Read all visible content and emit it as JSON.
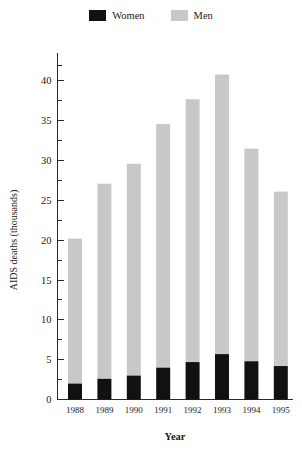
{
  "legend": {
    "entries": [
      {
        "label": "Women",
        "color": "#111111",
        "icon": "legend-swatch-women"
      },
      {
        "label": "Men",
        "color": "#c8c8c8",
        "icon": "legend-swatch-men"
      }
    ]
  },
  "chart_data": {
    "type": "bar",
    "subtype": "stacked-vertical",
    "title": "",
    "xlabel": "Year",
    "ylabel": "AIDS deaths (thousands)",
    "categories": [
      "1988",
      "1989",
      "1990",
      "1991",
      "1992",
      "1993",
      "1994",
      "1995"
    ],
    "series": [
      {
        "name": "Women",
        "color": "#111111",
        "values": [
          2.0,
          2.6,
          3.0,
          4.0,
          4.7,
          5.7,
          4.8,
          4.2
        ]
      },
      {
        "name": "Men",
        "color": "#c8c8c8",
        "values": [
          18.2,
          24.5,
          26.6,
          30.6,
          33.0,
          35.1,
          26.7,
          21.9
        ]
      }
    ],
    "totals": [
      20.2,
      27.1,
      29.6,
      34.6,
      37.7,
      40.8,
      31.5,
      26.1
    ],
    "ylim": [
      0,
      42
    ],
    "ytick_labels": [
      "0",
      "5",
      "10",
      "15",
      "20",
      "25",
      "30",
      "35",
      "40"
    ],
    "ytick_values": [
      0,
      5,
      10,
      15,
      20,
      25,
      30,
      35,
      40
    ],
    "yminor_values": [
      2.5,
      7.5,
      12.5,
      17.5,
      22.5,
      27.5,
      32.5,
      37.5,
      42
    ],
    "grid": false,
    "legend_position": "top-center"
  }
}
